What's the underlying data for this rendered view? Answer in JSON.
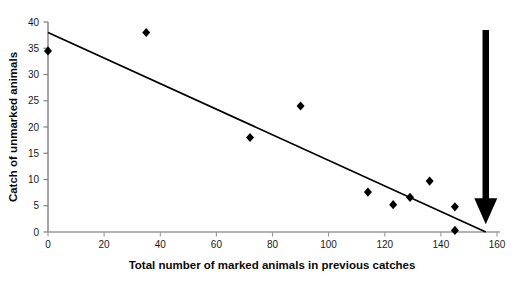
{
  "chart_data": {
    "type": "scatter",
    "title": "",
    "xlabel": "Total number of marked animals in previous catches",
    "ylabel": "Catch of unmarked animals",
    "xlim": [
      0,
      160
    ],
    "ylim": [
      0,
      40
    ],
    "xticks": [
      0,
      20,
      40,
      60,
      80,
      100,
      120,
      140,
      160
    ],
    "yticks": [
      0,
      5,
      10,
      15,
      20,
      25,
      30,
      35,
      40
    ],
    "xtick_labels": [
      "0",
      "20",
      "40",
      "60",
      "80",
      "100",
      "120",
      "140",
      "160"
    ],
    "ytick_labels": [
      "0",
      "5",
      "10",
      "15",
      "20",
      "25",
      "30",
      "35",
      "40"
    ],
    "grid": false,
    "legend": "none",
    "marker": "diamond",
    "marker_color": "#000000",
    "series": [
      {
        "name": "Catch of unmarked animals",
        "points": [
          {
            "x": 0,
            "y": 34.5
          },
          {
            "x": 35,
            "y": 38.0
          },
          {
            "x": 72,
            "y": 18.0
          },
          {
            "x": 90,
            "y": 24.0
          },
          {
            "x": 114,
            "y": 7.6
          },
          {
            "x": 123,
            "y": 5.2
          },
          {
            "x": 129,
            "y": 6.6
          },
          {
            "x": 136,
            "y": 9.7
          },
          {
            "x": 145,
            "y": 4.8
          },
          {
            "x": 145,
            "y": 0.3
          }
        ]
      }
    ],
    "trendline": {
      "type": "linear-regression",
      "color": "#000000",
      "x_start": 0,
      "y_start": 38.0,
      "x_end": 156,
      "y_end": 0.0
    },
    "annotations": [
      {
        "kind": "arrow",
        "name": "x-intercept-arrow",
        "direction": "down",
        "color": "#000000",
        "x": 156,
        "y_top": 38.5,
        "y_tip": 1.5
      }
    ]
  }
}
